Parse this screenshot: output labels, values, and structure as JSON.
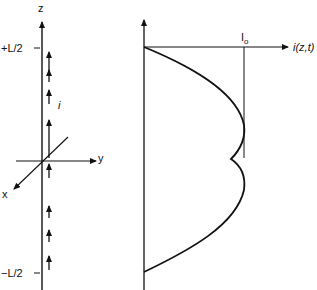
{
  "left_panel": {
    "z_label": "z",
    "y_label": "y",
    "x_label": "x",
    "top_label": "+L/2",
    "bottom_label": "−L/2",
    "current_label": "i"
  },
  "right_panel": {
    "peak_label": "I",
    "peak_subscript": "o",
    "axis_label": "i(z,t)"
  }
}
